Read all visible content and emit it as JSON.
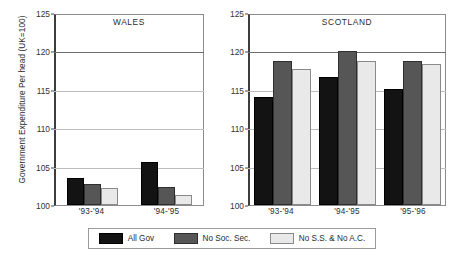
{
  "chart_data": {
    "type": "bar",
    "title": "",
    "ylabel": "Government Expenditure Per head (UK=100)",
    "xlabel": "",
    "ylim": [
      100,
      125
    ],
    "yticks": [
      100,
      105,
      110,
      115,
      120,
      125
    ],
    "grid": true,
    "legend_position": "bottom",
    "legend": [
      "All Gov",
      "No Soc. Sec.",
      "No S.S. & No A.C."
    ],
    "panels": [
      {
        "title": "WALES",
        "categories": [
          "'93-'94",
          "'94-'95"
        ],
        "series": [
          {
            "name": "All Gov",
            "values": [
              103.5,
              105.6
            ]
          },
          {
            "name": "No Soc. Sec.",
            "values": [
              102.8,
              102.3
            ]
          },
          {
            "name": "No S.S. & No A.C.",
            "values": [
              102.2,
              101.3
            ]
          }
        ]
      },
      {
        "title": "SCOTLAND",
        "categories": [
          "'93-'94",
          "'94-'95",
          "'95-'96"
        ],
        "series": [
          {
            "name": "All Gov",
            "values": [
              114.0,
              116.7,
              115.1
            ]
          },
          {
            "name": "No Soc. Sec.",
            "values": [
              118.7,
              120.1,
              118.8
            ]
          },
          {
            "name": "No S.S. & No A.C.",
            "values": [
              117.7,
              118.7,
              118.3
            ]
          }
        ]
      }
    ],
    "colors": {
      "all_gov": "#131313",
      "no_soc_sec": "#565656",
      "no_ss_no_ac": "#e9e9e9",
      "gridline": "#bdbdbd",
      "axis": "#3d3d3d"
    }
  }
}
